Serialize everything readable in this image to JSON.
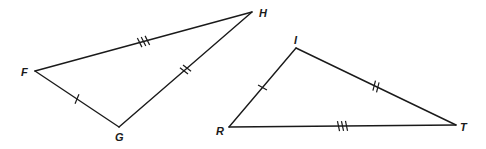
{
  "diagram": {
    "type": "congruent-triangles",
    "colors": {
      "stroke": "#1a1a1a",
      "background": "#ffffff"
    },
    "triangles": [
      {
        "name": "FGH",
        "vertices": [
          {
            "label": "F",
            "x": 35,
            "y": 71,
            "lx": 21,
            "ly": 76
          },
          {
            "label": "G",
            "x": 119,
            "y": 127,
            "lx": 115,
            "ly": 141
          },
          {
            "label": "H",
            "x": 252,
            "y": 12,
            "lx": 259,
            "ly": 17
          }
        ],
        "sides": [
          {
            "from": "F",
            "to": "G",
            "ticks": 1
          },
          {
            "from": "G",
            "to": "H",
            "ticks": 2
          },
          {
            "from": "F",
            "to": "H",
            "ticks": 3
          }
        ]
      },
      {
        "name": "RIT",
        "vertices": [
          {
            "label": "I",
            "x": 296,
            "y": 48,
            "lx": 294,
            "ly": 44
          },
          {
            "label": "R",
            "x": 229,
            "y": 127,
            "lx": 216,
            "ly": 135
          },
          {
            "label": "T",
            "x": 456,
            "y": 125,
            "lx": 460,
            "ly": 131
          }
        ],
        "sides": [
          {
            "from": "R",
            "to": "I",
            "ticks": 1
          },
          {
            "from": "I",
            "to": "T",
            "ticks": 2
          },
          {
            "from": "R",
            "to": "T",
            "ticks": 3
          }
        ]
      }
    ]
  }
}
